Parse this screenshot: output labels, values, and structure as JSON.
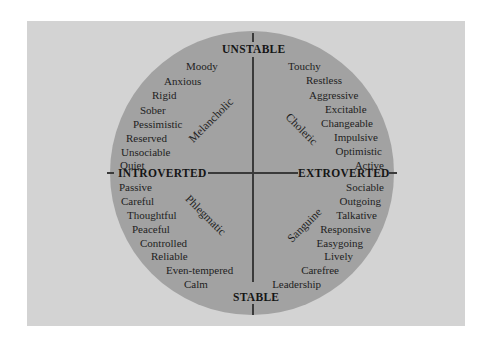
{
  "diagram": {
    "colors": {
      "panel": "#d3d3d3",
      "circle": "#a2a2a2",
      "lines": "#3a3a3a",
      "text": "#1e1e1e"
    },
    "axes": {
      "top": "UNSTABLE",
      "bottom": "STABLE",
      "left": "INTROVERTED",
      "right": "EXTROVERTED"
    },
    "quadrants": {
      "melancholic": {
        "label": "Melancholic",
        "traits": [
          "Moody",
          "Anxious",
          "Rigid",
          "Sober",
          "Pessimistic",
          "Reserved",
          "Unsociable",
          "Quiet"
        ]
      },
      "choleric": {
        "label": "Choleric",
        "traits": [
          "Touchy",
          "Restless",
          "Aggressive",
          "Excitable",
          "Changeable",
          "Impulsive",
          "Optimistic",
          "Active"
        ]
      },
      "phlegmatic": {
        "label": "Phlegmatic",
        "traits": [
          "Passive",
          "Careful",
          "Thoughtful",
          "Peaceful",
          "Controlled",
          "Reliable",
          "Even-tempered",
          "Calm"
        ]
      },
      "sanguine": {
        "label": "Sanguine",
        "traits": [
          "Sociable",
          "Outgoing",
          "Talkative",
          "Responsive",
          "Easygoing",
          "Lively",
          "Carefree",
          "Leadership"
        ]
      }
    }
  }
}
